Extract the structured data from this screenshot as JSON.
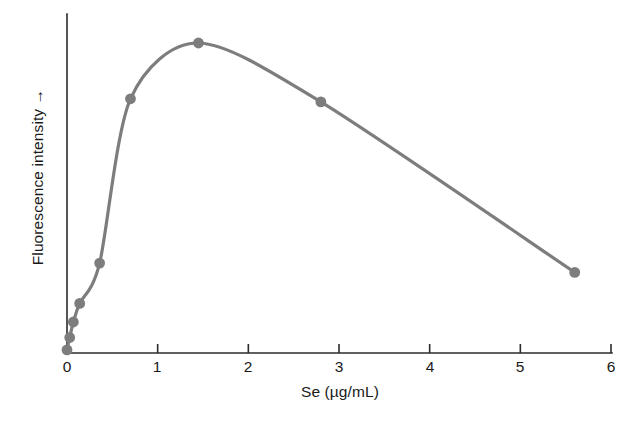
{
  "figure": {
    "background_color": "#ffffff",
    "axis_color": "#2b2b2b",
    "series_color": "#7d7d7d"
  },
  "axes": {
    "x_title": "Se (µg/mL)",
    "y_title": "Fluorescence intensity →",
    "x_ticks": [
      "0",
      "1",
      "2",
      "3",
      "4",
      "5",
      "6"
    ],
    "y_ticks": []
  },
  "chart_data": {
    "type": "line",
    "title": "",
    "subtitle": "",
    "xlabel": "Se (µg/mL)",
    "ylabel": "Fluorescence intensity →",
    "xlim": [
      0,
      6
    ],
    "ylim": [
      0,
      105
    ],
    "xticks": [
      0,
      1,
      2,
      3,
      4,
      5,
      6
    ],
    "yticks": [],
    "grid": false,
    "legend": null,
    "legend_position": "none",
    "markers": true,
    "marker_shape": "circle",
    "line_color": "#7d7d7d",
    "annotations": [],
    "x": [
      0,
      0.03,
      0.07,
      0.14,
      0.36,
      0.7,
      1.45,
      2.8,
      5.6
    ],
    "y": [
      1,
      5,
      10,
      16,
      29,
      82,
      100,
      81,
      26
    ],
    "series": [
      {
        "name": "Fluorescence intensity",
        "points": [
          {
            "x": 0,
            "y": 1
          },
          {
            "x": 0.03,
            "y": 5
          },
          {
            "x": 0.07,
            "y": 10
          },
          {
            "x": 0.14,
            "y": 16
          },
          {
            "x": 0.36,
            "y": 29
          },
          {
            "x": 0.7,
            "y": 82
          },
          {
            "x": 1.45,
            "y": 100
          },
          {
            "x": 2.8,
            "y": 81
          },
          {
            "x": 5.6,
            "y": 26
          }
        ]
      }
    ]
  }
}
